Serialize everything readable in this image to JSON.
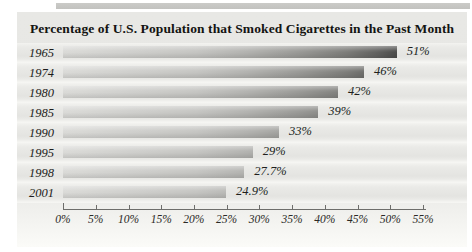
{
  "figure": {
    "top_strip_color": "#c6c6c3",
    "panel_bg": "#e7e7e4"
  },
  "chart_data": {
    "type": "bar",
    "orientation": "horizontal",
    "title": "Percentage of U.S. Population that Smoked Cigarettes in the Past Month",
    "categories": [
      "1965",
      "1974",
      "1980",
      "1985",
      "1990",
      "1995",
      "1998",
      "2001"
    ],
    "values": [
      51,
      46,
      42,
      39,
      33,
      29,
      27.7,
      24.9
    ],
    "value_labels": [
      "51%",
      "46%",
      "42%",
      "39%",
      "33%",
      "29%",
      "27.7%",
      "24.9%"
    ],
    "rows": [
      {
        "year": "1965",
        "value": 51,
        "label": "51%"
      },
      {
        "year": "1974",
        "value": 46,
        "label": "46%"
      },
      {
        "year": "1980",
        "value": 42,
        "label": "42%"
      },
      {
        "year": "1985",
        "value": 39,
        "label": "39%"
      },
      {
        "year": "1990",
        "value": 33,
        "label": "33%"
      },
      {
        "year": "1995",
        "value": 29,
        "label": "29%"
      },
      {
        "year": "1998",
        "value": 27.7,
        "label": "27.7%"
      },
      {
        "year": "2001",
        "value": 24.9,
        "label": "24.9%"
      }
    ],
    "xlabel": "",
    "ylabel": "",
    "xlim": [
      0,
      55
    ],
    "x_tick_values": [
      0,
      5,
      10,
      15,
      20,
      25,
      30,
      35,
      40,
      45,
      50,
      55
    ],
    "x_ticks": [
      "0%",
      "5%",
      "10%",
      "15%",
      "20%",
      "25%",
      "30%",
      "35%",
      "40%",
      "45%",
      "50%",
      "55%"
    ],
    "grid": false,
    "legend": false,
    "bar_gradient": {
      "start": "#dadad7",
      "end": "#4c4c4a"
    },
    "axis_color": "#6e6e6b"
  }
}
